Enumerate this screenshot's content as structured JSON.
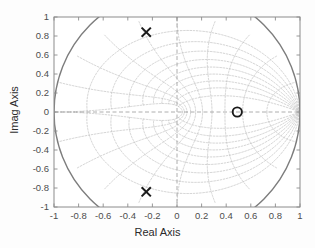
{
  "figure": {
    "background_color": "#fdfdfd",
    "axes_color": "#8c8c8c",
    "tick_label_color": "#4d4d4d",
    "label_color": "#2b2b2b",
    "marker_color": "#1a1a1a",
    "grid_color": "#b9b9b9",
    "unit_circle_color": "#7d7d7d"
  },
  "chart_data": {
    "type": "scatter",
    "title": "",
    "xlabel": "Real Axis",
    "ylabel": "Imag Axis",
    "xlim": [
      -1,
      1
    ],
    "ylim": [
      -1,
      1
    ],
    "xticks": [
      "-1",
      "-0.8",
      "-0.6",
      "-0.4",
      "-0.2",
      "0",
      "0.2",
      "0.4",
      "0.6",
      "0.8",
      "1"
    ],
    "yticks": [
      "1",
      "0.8",
      "0.6",
      "0.4",
      "0.2",
      "0",
      "-0.2",
      "-0.4",
      "-0.6",
      "-0.8",
      "-1"
    ],
    "xtick_values": [
      -1,
      -0.8,
      -0.6,
      -0.4,
      -0.2,
      0,
      0.2,
      0.4,
      0.6,
      0.8,
      1
    ],
    "ytick_values": [
      1,
      0.8,
      0.6,
      0.4,
      0.2,
      0,
      -0.2,
      -0.4,
      -0.6,
      -0.8,
      -1
    ],
    "grid": true,
    "grid_style": "zgrid",
    "legend": "none",
    "series": [
      {
        "name": "poles",
        "marker": "x",
        "values": [
          {
            "x": -0.25,
            "y": 0.84
          },
          {
            "x": -0.25,
            "y": -0.84
          }
        ]
      },
      {
        "name": "zeros",
        "marker": "o",
        "values": [
          {
            "x": 0.49,
            "y": 0.0
          }
        ]
      }
    ],
    "annotations": {
      "unit_circle_radius": 1,
      "damping_lines": [
        0.1,
        0.2,
        0.3,
        0.4,
        0.5,
        0.6,
        0.7,
        0.8,
        0.9
      ],
      "frequency_arcs": [
        0.1,
        0.2,
        0.3,
        0.4,
        0.5,
        0.6,
        0.7,
        0.8,
        0.9,
        1.0
      ],
      "real_axis_line": true,
      "imag_axis_line": true
    }
  }
}
